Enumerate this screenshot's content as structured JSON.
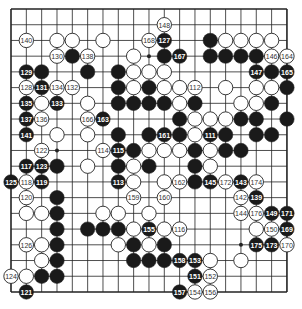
{
  "board": {
    "size": 19,
    "origin_x": 11,
    "origin_y": 9,
    "spacing_x": 15.33,
    "spacing_y": 15.72,
    "stone_radius": 7.2,
    "line_color": "#222222",
    "black_color": "#1a1a1a",
    "white_color": "#ffffff",
    "star_points": [
      [
        3,
        3
      ],
      [
        9,
        3
      ],
      [
        15,
        3
      ],
      [
        3,
        9
      ],
      [
        9,
        9
      ],
      [
        15,
        9
      ],
      [
        3,
        15
      ],
      [
        9,
        15
      ],
      [
        15,
        15
      ]
    ],
    "visible_star_points": [
      [
        9,
        3
      ],
      [
        3,
        9
      ],
      [
        15,
        15
      ]
    ]
  },
  "stones": [
    {
      "c": 10,
      "r": 1,
      "color": "white",
      "label": "148"
    },
    {
      "c": 1,
      "r": 2,
      "color": "white",
      "label": "140"
    },
    {
      "c": 3,
      "r": 2,
      "color": "white",
      "label": ""
    },
    {
      "c": 4,
      "r": 2,
      "color": "white",
      "label": ""
    },
    {
      "c": 6,
      "r": 2,
      "color": "white",
      "label": ""
    },
    {
      "c": 9,
      "r": 2,
      "color": "white",
      "label": "168"
    },
    {
      "c": 10,
      "r": 2,
      "color": "black",
      "label": "127"
    },
    {
      "c": 13,
      "r": 2,
      "color": "black",
      "label": ""
    },
    {
      "c": 14,
      "r": 2,
      "color": "white",
      "label": ""
    },
    {
      "c": 15,
      "r": 2,
      "color": "white",
      "label": ""
    },
    {
      "c": 16,
      "r": 2,
      "color": "white",
      "label": ""
    },
    {
      "c": 17,
      "r": 2,
      "color": "white",
      "label": ""
    },
    {
      "c": 3,
      "r": 3,
      "color": "white",
      "label": "130"
    },
    {
      "c": 4,
      "r": 3,
      "color": "black",
      "label": ""
    },
    {
      "c": 5,
      "r": 3,
      "color": "white",
      "label": "138"
    },
    {
      "c": 8,
      "r": 3,
      "color": "white",
      "label": ""
    },
    {
      "c": 10,
      "r": 3,
      "color": "black",
      "label": ""
    },
    {
      "c": 11,
      "r": 3,
      "color": "black",
      "label": "167"
    },
    {
      "c": 13,
      "r": 3,
      "color": "black",
      "label": ""
    },
    {
      "c": 14,
      "r": 3,
      "color": "black",
      "label": ""
    },
    {
      "c": 15,
      "r": 3,
      "color": "black",
      "label": ""
    },
    {
      "c": 16,
      "r": 3,
      "color": "black",
      "label": ""
    },
    {
      "c": 17,
      "r": 3,
      "color": "white",
      "label": "146"
    },
    {
      "c": 18,
      "r": 3,
      "color": "white",
      "label": "164"
    },
    {
      "c": 1,
      "r": 4,
      "color": "black",
      "label": "129"
    },
    {
      "c": 2,
      "r": 4,
      "color": "black",
      "label": ""
    },
    {
      "c": 5,
      "r": 4,
      "color": "black",
      "label": ""
    },
    {
      "c": 7,
      "r": 4,
      "color": "black",
      "label": ""
    },
    {
      "c": 8,
      "r": 4,
      "color": "white",
      "label": ""
    },
    {
      "c": 9,
      "r": 4,
      "color": "white",
      "label": ""
    },
    {
      "c": 10,
      "r": 4,
      "color": "white",
      "label": ""
    },
    {
      "c": 16,
      "r": 4,
      "color": "black",
      "label": "147"
    },
    {
      "c": 17,
      "r": 4,
      "color": "black",
      "label": ""
    },
    {
      "c": 18,
      "r": 4,
      "color": "black",
      "label": "165"
    },
    {
      "c": 1,
      "r": 5,
      "color": "white",
      "label": "128"
    },
    {
      "c": 2,
      "r": 5,
      "color": "black",
      "label": "131"
    },
    {
      "c": 3,
      "r": 5,
      "color": "white",
      "label": "134"
    },
    {
      "c": 4,
      "r": 5,
      "color": "white",
      "label": "132"
    },
    {
      "c": 7,
      "r": 5,
      "color": "black",
      "label": ""
    },
    {
      "c": 8,
      "r": 5,
      "color": "white",
      "label": ""
    },
    {
      "c": 9,
      "r": 5,
      "color": "black",
      "label": ""
    },
    {
      "c": 10,
      "r": 5,
      "color": "white",
      "label": ""
    },
    {
      "c": 11,
      "r": 5,
      "color": "white",
      "label": ""
    },
    {
      "c": 12,
      "r": 5,
      "color": "white",
      "label": "112"
    },
    {
      "c": 14,
      "r": 5,
      "color": "white",
      "label": ""
    },
    {
      "c": 16,
      "r": 5,
      "color": "white",
      "label": ""
    },
    {
      "c": 17,
      "r": 5,
      "color": "white",
      "label": ""
    },
    {
      "c": 18,
      "r": 5,
      "color": "black",
      "label": ""
    },
    {
      "c": 1,
      "r": 6,
      "color": "black",
      "label": "135"
    },
    {
      "c": 2,
      "r": 6,
      "color": "white",
      "label": ""
    },
    {
      "c": 3,
      "r": 6,
      "color": "black",
      "label": "133"
    },
    {
      "c": 5,
      "r": 6,
      "color": "white",
      "label": ""
    },
    {
      "c": 7,
      "r": 6,
      "color": "black",
      "label": ""
    },
    {
      "c": 8,
      "r": 6,
      "color": "black",
      "label": ""
    },
    {
      "c": 9,
      "r": 6,
      "color": "black",
      "label": ""
    },
    {
      "c": 10,
      "r": 6,
      "color": "black",
      "label": ""
    },
    {
      "c": 11,
      "r": 6,
      "color": "white",
      "label": ""
    },
    {
      "c": 12,
      "r": 6,
      "color": "black",
      "label": ""
    },
    {
      "c": 15,
      "r": 6,
      "color": "white",
      "label": ""
    },
    {
      "c": 16,
      "r": 6,
      "color": "white",
      "label": ""
    },
    {
      "c": 17,
      "r": 6,
      "color": "black",
      "label": ""
    },
    {
      "c": 1,
      "r": 7,
      "color": "black",
      "label": "137"
    },
    {
      "c": 2,
      "r": 7,
      "color": "white",
      "label": "136"
    },
    {
      "c": 5,
      "r": 7,
      "color": "white",
      "label": "166"
    },
    {
      "c": 6,
      "r": 7,
      "color": "black",
      "label": "163"
    },
    {
      "c": 11,
      "r": 7,
      "color": "black",
      "label": ""
    },
    {
      "c": 12,
      "r": 7,
      "color": "white",
      "label": ""
    },
    {
      "c": 13,
      "r": 7,
      "color": "white",
      "label": ""
    },
    {
      "c": 14,
      "r": 7,
      "color": "white",
      "label": ""
    },
    {
      "c": 15,
      "r": 7,
      "color": "black",
      "label": ""
    },
    {
      "c": 16,
      "r": 7,
      "color": "black",
      "label": ""
    },
    {
      "c": 18,
      "r": 7,
      "color": "black",
      "label": ""
    },
    {
      "c": 1,
      "r": 8,
      "color": "black",
      "label": "141"
    },
    {
      "c": 3,
      "r": 8,
      "color": "white",
      "label": ""
    },
    {
      "c": 5,
      "r": 8,
      "color": "white",
      "label": ""
    },
    {
      "c": 7,
      "r": 8,
      "color": "black",
      "label": ""
    },
    {
      "c": 9,
      "r": 8,
      "color": "black",
      "label": ""
    },
    {
      "c": 10,
      "r": 8,
      "color": "black",
      "label": "161"
    },
    {
      "c": 11,
      "r": 8,
      "color": "black",
      "label": ""
    },
    {
      "c": 12,
      "r": 8,
      "color": "white",
      "label": ""
    },
    {
      "c": 13,
      "r": 8,
      "color": "black",
      "label": "111"
    },
    {
      "c": 14,
      "r": 8,
      "color": "black",
      "label": ""
    },
    {
      "c": 16,
      "r": 8,
      "color": "black",
      "label": ""
    },
    {
      "c": 17,
      "r": 8,
      "color": "black",
      "label": ""
    },
    {
      "c": 2,
      "r": 9,
      "color": "white",
      "label": "122"
    },
    {
      "c": 6,
      "r": 9,
      "color": "white",
      "label": "114"
    },
    {
      "c": 7,
      "r": 9,
      "color": "black",
      "label": "115"
    },
    {
      "c": 8,
      "r": 9,
      "color": "black",
      "label": ""
    },
    {
      "c": 9,
      "r": 9,
      "color": "white",
      "label": ""
    },
    {
      "c": 10,
      "r": 9,
      "color": "white",
      "label": ""
    },
    {
      "c": 11,
      "r": 9,
      "color": "white",
      "label": ""
    },
    {
      "c": 12,
      "r": 9,
      "color": "black",
      "label": ""
    },
    {
      "c": 13,
      "r": 9,
      "color": "white",
      "label": ""
    },
    {
      "c": 14,
      "r": 9,
      "color": "black",
      "label": ""
    },
    {
      "c": 15,
      "r": 9,
      "color": "black",
      "label": ""
    },
    {
      "c": 1,
      "r": 10,
      "color": "black",
      "label": "117"
    },
    {
      "c": 2,
      "r": 10,
      "color": "black",
      "label": "123"
    },
    {
      "c": 3,
      "r": 10,
      "color": "black",
      "label": ""
    },
    {
      "c": 5,
      "r": 10,
      "color": "white",
      "label": ""
    },
    {
      "c": 7,
      "r": 10,
      "color": "black",
      "label": ""
    },
    {
      "c": 8,
      "r": 10,
      "color": "white",
      "label": ""
    },
    {
      "c": 9,
      "r": 10,
      "color": "black",
      "label": ""
    },
    {
      "c": 12,
      "r": 10,
      "color": "black",
      "label": ""
    },
    {
      "c": 13,
      "r": 10,
      "color": "white",
      "label": ""
    },
    {
      "c": 0,
      "r": 11,
      "color": "black",
      "label": "125"
    },
    {
      "c": 1,
      "r": 11,
      "color": "white",
      "label": "118"
    },
    {
      "c": 2,
      "r": 11,
      "color": "black",
      "label": "119"
    },
    {
      "c": 7,
      "r": 11,
      "color": "black",
      "label": "113"
    },
    {
      "c": 8,
      "r": 11,
      "color": "white",
      "label": ""
    },
    {
      "c": 10,
      "r": 11,
      "color": "white",
      "label": ""
    },
    {
      "c": 11,
      "r": 11,
      "color": "white",
      "label": "162"
    },
    {
      "c": 12,
      "r": 11,
      "color": "black",
      "label": ""
    },
    {
      "c": 13,
      "r": 11,
      "color": "black",
      "label": "145"
    },
    {
      "c": 14,
      "r": 11,
      "color": "white",
      "label": "172"
    },
    {
      "c": 15,
      "r": 11,
      "color": "black",
      "label": "143"
    },
    {
      "c": 16,
      "r": 11,
      "color": "white",
      "label": "174"
    },
    {
      "c": 1,
      "r": 12,
      "color": "white",
      "label": "120"
    },
    {
      "c": 3,
      "r": 12,
      "color": "black",
      "label": ""
    },
    {
      "c": 8,
      "r": 12,
      "color": "white",
      "label": "159"
    },
    {
      "c": 10,
      "r": 12,
      "color": "white",
      "label": "160"
    },
    {
      "c": 15,
      "r": 12,
      "color": "white",
      "label": "142"
    },
    {
      "c": 16,
      "r": 12,
      "color": "black",
      "label": "139"
    },
    {
      "c": 1,
      "r": 13,
      "color": "white",
      "label": ""
    },
    {
      "c": 2,
      "r": 13,
      "color": "white",
      "label": ""
    },
    {
      "c": 3,
      "r": 13,
      "color": "black",
      "label": ""
    },
    {
      "c": 6,
      "r": 13,
      "color": "white",
      "label": ""
    },
    {
      "c": 7,
      "r": 13,
      "color": "white",
      "label": ""
    },
    {
      "c": 9,
      "r": 13,
      "color": "white",
      "label": ""
    },
    {
      "c": 15,
      "r": 13,
      "color": "white",
      "label": "144"
    },
    {
      "c": 16,
      "r": 13,
      "color": "white",
      "label": "176"
    },
    {
      "c": 17,
      "r": 13,
      "color": "black",
      "label": "149"
    },
    {
      "c": 18,
      "r": 13,
      "color": "black",
      "label": "171"
    },
    {
      "c": 3,
      "r": 14,
      "color": "black",
      "label": ""
    },
    {
      "c": 5,
      "r": 14,
      "color": "black",
      "label": ""
    },
    {
      "c": 6,
      "r": 14,
      "color": "black",
      "label": ""
    },
    {
      "c": 7,
      "r": 14,
      "color": "black",
      "label": ""
    },
    {
      "c": 8,
      "r": 14,
      "color": "white",
      "label": ""
    },
    {
      "c": 9,
      "r": 14,
      "color": "black",
      "label": "155"
    },
    {
      "c": 10,
      "r": 14,
      "color": "white",
      "label": ""
    },
    {
      "c": 11,
      "r": 14,
      "color": "white",
      "label": "116"
    },
    {
      "c": 16,
      "r": 14,
      "color": "white",
      "label": ""
    },
    {
      "c": 17,
      "r": 14,
      "color": "white",
      "label": "150"
    },
    {
      "c": 18,
      "r": 14,
      "color": "black",
      "label": "169"
    },
    {
      "c": 1,
      "r": 15,
      "color": "white",
      "label": "126"
    },
    {
      "c": 2,
      "r": 15,
      "color": "white",
      "label": ""
    },
    {
      "c": 3,
      "r": 15,
      "color": "black",
      "label": ""
    },
    {
      "c": 7,
      "r": 15,
      "color": "white",
      "label": ""
    },
    {
      "c": 8,
      "r": 15,
      "color": "black",
      "label": ""
    },
    {
      "c": 9,
      "r": 15,
      "color": "white",
      "label": ""
    },
    {
      "c": 10,
      "r": 15,
      "color": "black",
      "label": ""
    },
    {
      "c": 16,
      "r": 15,
      "color": "black",
      "label": "175"
    },
    {
      "c": 17,
      "r": 15,
      "color": "black",
      "label": "173"
    },
    {
      "c": 18,
      "r": 15,
      "color": "white",
      "label": "170"
    },
    {
      "c": 2,
      "r": 16,
      "color": "white",
      "label": ""
    },
    {
      "c": 3,
      "r": 16,
      "color": "black",
      "label": ""
    },
    {
      "c": 8,
      "r": 16,
      "color": "black",
      "label": ""
    },
    {
      "c": 9,
      "r": 16,
      "color": "black",
      "label": ""
    },
    {
      "c": 10,
      "r": 16,
      "color": "black",
      "label": ""
    },
    {
      "c": 11,
      "r": 16,
      "color": "black",
      "label": "158"
    },
    {
      "c": 12,
      "r": 16,
      "color": "black",
      "label": "153"
    },
    {
      "c": 13,
      "r": 16,
      "color": "white",
      "label": ""
    },
    {
      "c": 15,
      "r": 16,
      "color": "white",
      "label": ""
    },
    {
      "c": 0,
      "r": 17,
      "color": "white",
      "label": "124"
    },
    {
      "c": 1,
      "r": 17,
      "color": "white",
      "label": ""
    },
    {
      "c": 2,
      "r": 17,
      "color": "black",
      "label": ""
    },
    {
      "c": 3,
      "r": 17,
      "color": "black",
      "label": ""
    },
    {
      "c": 12,
      "r": 17,
      "color": "black",
      "label": "151"
    },
    {
      "c": 13,
      "r": 17,
      "color": "white",
      "label": "152"
    },
    {
      "c": 1,
      "r": 18,
      "color": "black",
      "label": "121"
    },
    {
      "c": 11,
      "r": 18,
      "color": "black",
      "label": "157"
    },
    {
      "c": 12,
      "r": 18,
      "color": "white",
      "label": "154"
    },
    {
      "c": 13,
      "r": 18,
      "color": "white",
      "label": "156"
    }
  ]
}
